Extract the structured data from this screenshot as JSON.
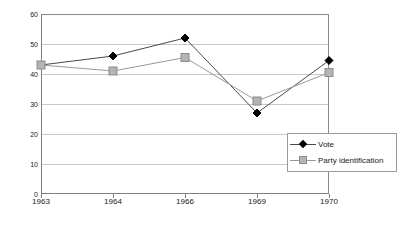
{
  "chart_data": {
    "type": "line",
    "title": "",
    "subtitle": "",
    "xlabel": "",
    "ylabel": "",
    "categories": [
      "1963",
      "1964",
      "1966",
      "1969",
      "1970"
    ],
    "series": [
      {
        "name": "Vote",
        "values": [
          43,
          46,
          52,
          27,
          44.5
        ],
        "color": "#000000",
        "marker": "diamond"
      },
      {
        "name": "Party identification",
        "values": [
          43,
          41,
          45.5,
          31,
          40.5
        ],
        "color": "#b4b4b4",
        "marker": "square"
      }
    ],
    "ylim": [
      0,
      60
    ],
    "yticks": [
      0,
      10,
      20,
      30,
      40,
      50,
      60
    ],
    "ytick_labels": [
      "0",
      "10",
      "20",
      "30",
      "40",
      "50",
      "60"
    ],
    "grid": true,
    "grid_axis": "y",
    "legend_position": "inside-bottom-right",
    "legend_border": true
  },
  "legend": {
    "entries": [
      {
        "label": "Vote",
        "marker_name": "diamond-marker-icon"
      },
      {
        "label": "Party identification",
        "marker_name": "square-marker-icon"
      }
    ]
  },
  "colors": {
    "vote_line": "#4a4a4a",
    "party_line": "#9a9a9a",
    "vote_marker": "#000000",
    "party_marker": "#b4b4b4",
    "party_marker_border": "#8c8c8c",
    "grid": "#c8c8c8",
    "axis": "#808080",
    "text": "#1a1a1a",
    "background": "#ffffff"
  }
}
